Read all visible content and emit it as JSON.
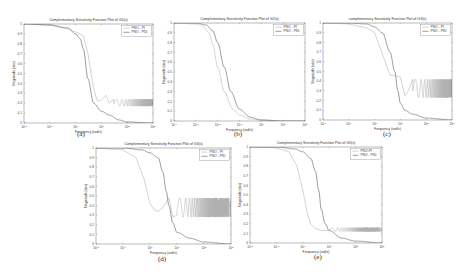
{
  "figure": {
    "panels": [
      {
        "id": "a",
        "caption": "(a)",
        "title": "Complementary Sensitivity Function Plot of G1(s)",
        "legend": [
          "PSO - PI",
          "PSO - PID"
        ]
      },
      {
        "id": "b",
        "caption": "(b)",
        "title": "Complementary Sensitivity Function Plot of G2(s)",
        "legend": [
          "PSO - PI",
          "PSO - PID"
        ]
      },
      {
        "id": "c",
        "caption": "(c)",
        "title": "complementary Sensitivity Function Plot of G3(s)",
        "legend": [
          "PSO - PI",
          "PSO - PID"
        ]
      },
      {
        "id": "d",
        "caption": "(d)",
        "title": "Complementary Sensitivity Function Plot of G4(s)",
        "legend": [
          "PSO - PI",
          "PSO - PID"
        ]
      },
      {
        "id": "e",
        "caption": "(e)",
        "title": "Complementary Sensitivity Function Plot of G5(s)",
        "legend": [
          "PSO-PI",
          "PSO - PID"
        ]
      }
    ]
  },
  "chart_data": [
    {
      "type": "line",
      "id": "a",
      "title": "Complementary Sensitivity Function Plot of G1(s)",
      "xlabel": "Frequency (rad/s)",
      "ylabel": "Magnitude (abs)",
      "xscale": "log",
      "xlim": [
        0.01,
        1000
      ],
      "ylim": [
        0,
        1
      ],
      "xticks": [
        "10^-2",
        "10^-1",
        "10^0",
        "10^1",
        "10^2",
        "10^3"
      ],
      "yticks": [
        0,
        0.1,
        0.2,
        0.3,
        0.4,
        0.5,
        0.6,
        0.7,
        0.8,
        0.9,
        1
      ],
      "legend_position": "upper right",
      "grid": false,
      "series": [
        {
          "name": "PSO - PI",
          "color": "#b0b0b0",
          "x": [
            0.01,
            0.1,
            0.5,
            1,
            1.5,
            2,
            3,
            5,
            7,
            10,
            15,
            20,
            30,
            50,
            100,
            1000
          ],
          "y": [
            1.0,
            0.99,
            0.95,
            0.92,
            0.9,
            0.88,
            0.7,
            0.35,
            0.22,
            0.23,
            0.28,
            0.2,
            0.24,
            0.2,
            0.22,
            0.2
          ],
          "note": "oscillates between ~0.17 and ~0.24 from ~30 rad/s onward"
        },
        {
          "name": "PSO - PID",
          "color": "#5a5a5a",
          "x": [
            0.01,
            0.1,
            0.5,
            1,
            1.5,
            2,
            3,
            5,
            10,
            20,
            50,
            100,
            1000
          ],
          "y": [
            1.0,
            0.99,
            0.96,
            0.9,
            0.85,
            0.75,
            0.45,
            0.2,
            0.12,
            0.08,
            0.03,
            0.01,
            0.0
          ]
        }
      ]
    },
    {
      "type": "line",
      "id": "b",
      "title": "Complementary Sensitivity Function Plot of G2(s)",
      "xlabel": "Frequency (rad/s)",
      "ylabel": "Magnitude (abs)",
      "xscale": "log",
      "xlim": [
        0.0001,
        100
      ],
      "ylim": [
        0,
        1
      ],
      "xticks": [
        "10^-4",
        "10^-3",
        "10^-2",
        "10^-1",
        "10^0",
        "10^1",
        "10^2"
      ],
      "yticks": [
        0,
        0.1,
        0.2,
        0.3,
        0.4,
        0.5,
        0.6,
        0.7,
        0.8,
        0.9,
        1
      ],
      "legend_position": "upper right",
      "grid": false,
      "series": [
        {
          "name": "PSO - PI",
          "color": "#b0b0b0",
          "x": [
            0.0001,
            0.001,
            0.002,
            0.004,
            0.006,
            0.01,
            0.02,
            0.05,
            0.1,
            0.3,
            1,
            10,
            100
          ],
          "y": [
            1.0,
            0.99,
            0.97,
            0.9,
            0.78,
            0.55,
            0.3,
            0.12,
            0.06,
            0.02,
            0.01,
            0.0,
            0.0
          ]
        },
        {
          "name": "PSO - PID",
          "color": "#5a5a5a",
          "x": [
            0.0001,
            0.001,
            0.003,
            0.006,
            0.01,
            0.02,
            0.04,
            0.1,
            0.3,
            1,
            10,
            100
          ],
          "y": [
            1.0,
            1.0,
            0.98,
            0.92,
            0.8,
            0.55,
            0.3,
            0.12,
            0.04,
            0.01,
            0.0,
            0.0
          ]
        }
      ]
    },
    {
      "type": "line",
      "id": "c",
      "title": "complementary Sensitivity Function Plot of G3(s)",
      "xlabel": "Frequency (rad/s)",
      "ylabel": "Magnitude (abs)",
      "xscale": "log",
      "xlim": [
        0.01,
        1000
      ],
      "ylim": [
        0,
        1
      ],
      "xticks": [
        "10^-2",
        "10^-1",
        "10^0",
        "10^1",
        "10^2",
        "10^3"
      ],
      "yticks": [
        0,
        0.1,
        0.2,
        0.3,
        0.4,
        0.5,
        0.6,
        0.7,
        0.8,
        0.9,
        1
      ],
      "legend_position": "upper right",
      "grid": false,
      "series": [
        {
          "name": "PSO - PI",
          "color": "#b0b0b0",
          "x": [
            0.01,
            0.1,
            0.5,
            1,
            2,
            4,
            6,
            10,
            15,
            20,
            30,
            50,
            100,
            1000
          ],
          "y": [
            1.0,
            0.99,
            0.95,
            0.9,
            0.68,
            0.46,
            0.46,
            0.44,
            0.25,
            0.3,
            0.42,
            0.3,
            0.35,
            0.33
          ],
          "note": "oscillates between ~0.23 and ~0.42 from ~30 rad/s onward"
        },
        {
          "name": "PSO - PID",
          "color": "#5a5a5a",
          "x": [
            0.01,
            0.1,
            0.5,
            1,
            2,
            4,
            6,
            8,
            10,
            15,
            30,
            100,
            1000
          ],
          "y": [
            1.0,
            1.0,
            0.99,
            0.96,
            0.9,
            0.7,
            0.5,
            0.3,
            0.17,
            0.1,
            0.06,
            0.02,
            0.0
          ]
        }
      ]
    },
    {
      "type": "line",
      "id": "d",
      "title": "Complementary Sensitivity Function Plot of G4(s)",
      "xlabel": "Frequency (rad/s)",
      "ylabel": "Magnitude (abs)",
      "xscale": "log",
      "xlim": [
        0.01,
        1000
      ],
      "ylim": [
        0,
        1
      ],
      "xticks": [
        "10^-2",
        "10^-1",
        "10^0",
        "10^1",
        "10^2",
        "10^3"
      ],
      "yticks": [
        0,
        0.1,
        0.2,
        0.3,
        0.4,
        0.5,
        0.6,
        0.7,
        0.8,
        0.9,
        1
      ],
      "legend_position": "upper right",
      "grid": false,
      "series": [
        {
          "name": "PSO - PI",
          "color": "#b0b0b0",
          "x": [
            0.01,
            0.1,
            0.3,
            0.6,
            1,
            1.5,
            2,
            3,
            5,
            7,
            10,
            15,
            20,
            1000
          ],
          "y": [
            1.0,
            0.98,
            0.9,
            0.68,
            0.42,
            0.35,
            0.34,
            0.38,
            0.48,
            0.28,
            0.3,
            0.5,
            0.3,
            0.4
          ],
          "note": "oscillates between ~0.28 and ~0.48 from ~10 rad/s onward"
        },
        {
          "name": "PSO - PID",
          "color": "#5a5a5a",
          "x": [
            0.01,
            0.1,
            0.5,
            1,
            2,
            3,
            4,
            5,
            7,
            10,
            30,
            100,
            1000
          ],
          "y": [
            1.0,
            1.0,
            0.98,
            0.95,
            0.9,
            0.75,
            0.55,
            0.4,
            0.22,
            0.12,
            0.06,
            0.02,
            0.0
          ]
        }
      ]
    },
    {
      "type": "line",
      "id": "e",
      "title": "Complementary Sensitivity Function Plot of G5(s)",
      "xlabel": "Frequency (rad/s)",
      "ylabel": "Magnitude (abs)",
      "xscale": "log",
      "xlim": [
        0.01,
        1000
      ],
      "ylim": [
        0,
        1
      ],
      "xticks": [
        "10^-2",
        "10^-1",
        "10^0",
        "10^1",
        "10^2",
        "10^3"
      ],
      "yticks": [
        0,
        0.1,
        0.2,
        0.3,
        0.4,
        0.5,
        0.6,
        0.7,
        0.8,
        0.9,
        1
      ],
      "legend_position": "upper right",
      "grid": false,
      "series": [
        {
          "name": "PSO-PI",
          "color": "#b0b0b0",
          "x": [
            0.01,
            0.1,
            0.3,
            0.6,
            1,
            1.5,
            2,
            3,
            5,
            10,
            15,
            20,
            30,
            1000
          ],
          "y": [
            1.0,
            0.99,
            0.95,
            0.8,
            0.55,
            0.3,
            0.2,
            0.15,
            0.13,
            0.13,
            0.15,
            0.12,
            0.15,
            0.14
          ],
          "note": "oscillates between ~0.12 and ~0.16 from ~10 rad/s onward"
        },
        {
          "name": "PSO - PID",
          "color": "#5a5a5a",
          "x": [
            0.01,
            0.1,
            0.5,
            1,
            2,
            3,
            4,
            5,
            7,
            10,
            30,
            100,
            1000
          ],
          "y": [
            1.0,
            1.0,
            0.98,
            0.95,
            0.88,
            0.75,
            0.55,
            0.35,
            0.2,
            0.13,
            0.05,
            0.02,
            0.0
          ]
        }
      ]
    }
  ]
}
